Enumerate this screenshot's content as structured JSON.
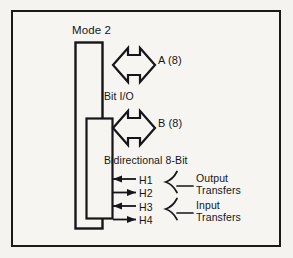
{
  "figure": {
    "title": "Mode 2",
    "bus_a": {
      "label": "A (8)",
      "caption": "Bit I/O",
      "icon": "bidirectional-bus-arrow-icon"
    },
    "bus_b": {
      "label": "B  (8)",
      "caption": "Bidirectional 8-Bit",
      "icon": "bidirectional-bus-arrow-icon"
    },
    "handshake_lines": [
      {
        "name": "H1",
        "direction": "left"
      },
      {
        "name": "H2",
        "direction": "right"
      },
      {
        "name": "H3",
        "direction": "left"
      },
      {
        "name": "H4",
        "direction": "right"
      }
    ],
    "groups": [
      {
        "line1": "Output",
        "line2": "Transfers"
      },
      {
        "line1": "Input",
        "line2": "Transfers"
      }
    ],
    "colors": {
      "ink": "#15151a",
      "paper": "#f6f5f2",
      "page": "#f4f3f0"
    }
  }
}
